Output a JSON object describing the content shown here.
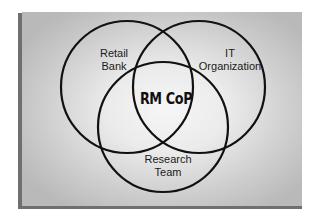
{
  "diagram": {
    "type": "venn",
    "sets": [
      {
        "id": "retail-bank",
        "lines": [
          "Retail",
          "Bank"
        ],
        "circle": {
          "cx": 127,
          "cy": 87,
          "r": 66
        }
      },
      {
        "id": "it-organization",
        "lines": [
          "IT",
          "Organization"
        ],
        "circle": {
          "cx": 199,
          "cy": 87,
          "r": 66
        }
      },
      {
        "id": "research-team",
        "lines": [
          "Research",
          "Team"
        ],
        "circle": {
          "cx": 163,
          "cy": 127,
          "r": 65
        }
      }
    ],
    "intersection_label": "RM CoP",
    "colors": {
      "stroke": "#111111",
      "panel_center": "#f6f6f6",
      "panel_edge": "#b9b9b9",
      "shadow": "#6f6f6f"
    }
  }
}
